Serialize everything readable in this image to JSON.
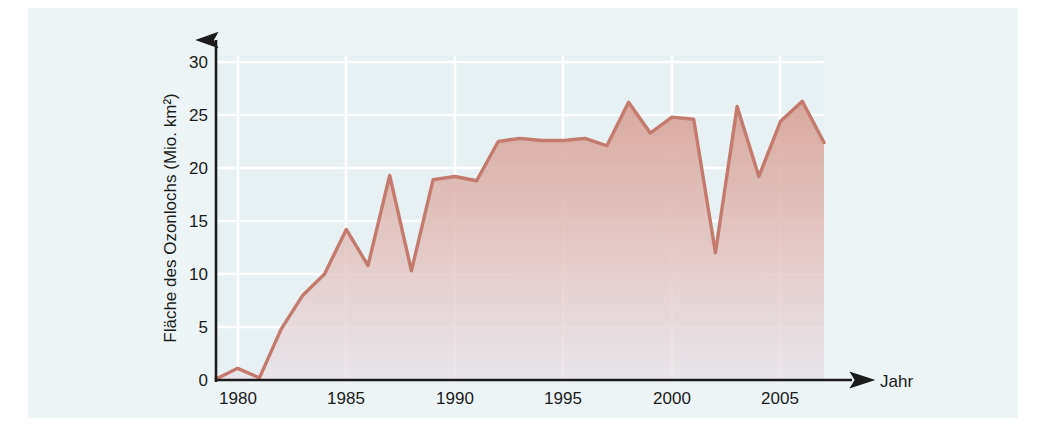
{
  "figure": {
    "background_color": "#edf4f5",
    "page_color": "#ffffff",
    "gridline_color": "#ffffff",
    "axis_color": "#1b1b1b",
    "line_color": "#c47a6e",
    "fill_top_color": "#d9a89f",
    "fill_bottom_color": "#e9dfe4"
  },
  "axes": {
    "y_title": "Fläche des Ozonlochs (Mio. km²)",
    "x_title": "Jahr",
    "y_ticks": [
      "0",
      "5",
      "10",
      "15",
      "20",
      "25",
      "30"
    ],
    "x_ticks": [
      "1980",
      "1985",
      "1990",
      "1995",
      "2000",
      "2005"
    ]
  },
  "chart_data": {
    "type": "area",
    "title": "",
    "subtitle": "",
    "xlabel": "Jahr",
    "ylabel": "Fläche des Ozonlochs (Mio. km²)",
    "xlim": [
      1979,
      2007
    ],
    "ylim": [
      0,
      30
    ],
    "ytick_values": [
      0,
      5,
      10,
      15,
      20,
      25,
      30
    ],
    "xtick_values": [
      1980,
      1985,
      1990,
      1995,
      2000,
      2005
    ],
    "grid": true,
    "legend": "none",
    "units": "Mio. km²",
    "x": [
      1979,
      1980,
      1981,
      1982,
      1983,
      1984,
      1985,
      1986,
      1987,
      1988,
      1989,
      1990,
      1991,
      1992,
      1993,
      1994,
      1995,
      1996,
      1997,
      1998,
      1999,
      2000,
      2001,
      2002,
      2003,
      2004,
      2005,
      2006,
      2007
    ],
    "series": [
      {
        "name": "Fläche des Ozonlochs",
        "values": [
          0.1,
          1.1,
          0.2,
          4.8,
          8.0,
          10.0,
          14.2,
          10.8,
          19.3,
          10.3,
          18.9,
          19.2,
          18.8,
          22.5,
          22.8,
          22.6,
          22.6,
          22.8,
          22.1,
          26.2,
          23.3,
          24.8,
          24.6,
          12.0,
          25.8,
          19.2,
          24.4,
          26.3,
          22.4
        ]
      }
    ]
  }
}
